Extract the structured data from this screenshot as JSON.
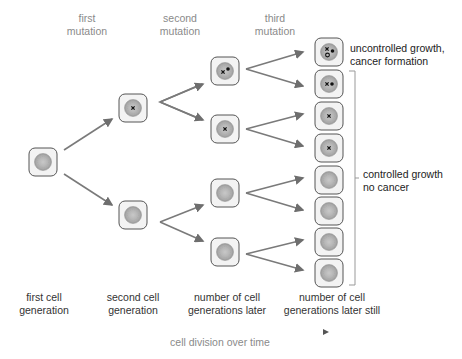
{
  "mutation_labels": [
    {
      "line1": "first",
      "line2": "mutation"
    },
    {
      "line1": "second",
      "line2": "mutation"
    },
    {
      "line1": "third",
      "line2": "mutation"
    }
  ],
  "generation_labels": [
    {
      "line1": "first cell",
      "line2": "generation"
    },
    {
      "line1": "second cell",
      "line2": "generation"
    },
    {
      "line1": "number of cell",
      "line2": "generations later"
    },
    {
      "line1": "number of cell",
      "line2": "generations later still"
    }
  ],
  "outcomes": {
    "cancer": {
      "line1": "uncontrolled growth,",
      "line2": "cancer formation"
    },
    "no_cancer": {
      "line1": "controlled growth",
      "line2": "no cancer"
    }
  },
  "timeline": {
    "label": "cell division over time"
  },
  "colors": {
    "arrow": "#6e6e6e",
    "cell_border": "#555555",
    "cell_fill": "#f2f2f2",
    "nucleus": "#b5b5b5"
  },
  "cells": {
    "gen1": [
      {
        "mutations": 0
      }
    ],
    "gen2": [
      {
        "mutations": 1
      },
      {
        "mutations": 0
      }
    ],
    "gen3": [
      {
        "mutations": 2
      },
      {
        "mutations": 1
      },
      {
        "mutations": 0
      },
      {
        "mutations": 0
      }
    ],
    "gen4": [
      {
        "mutations": 3
      },
      {
        "mutations": 2
      },
      {
        "mutations": 1
      },
      {
        "mutations": 1
      },
      {
        "mutations": 0
      },
      {
        "mutations": 0
      },
      {
        "mutations": 0
      },
      {
        "mutations": 0
      }
    ]
  }
}
